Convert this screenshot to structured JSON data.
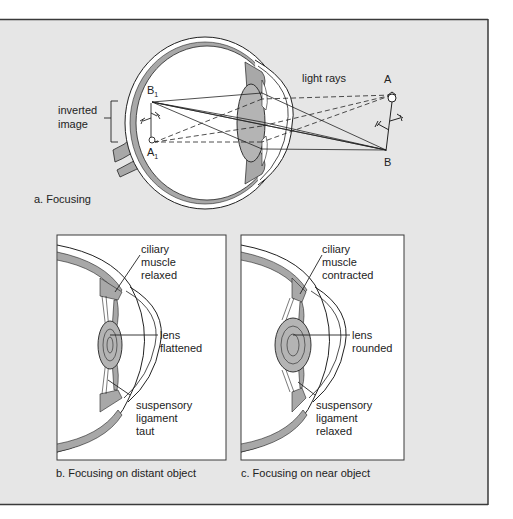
{
  "figure": {
    "colors": {
      "panel_bg": "#e6e6e6",
      "frame": "#3a3a3a",
      "tissue_gray": "#a8a8a8",
      "lens_gray": "#b4b4b4",
      "eye_white": "#ffffff",
      "ink": "#222222"
    },
    "panel_a": {
      "caption": "a. Focusing",
      "labels": {
        "inverted_image_1": "inverted",
        "inverted_image_2": "image",
        "light_rays": "light rays",
        "point_a": "A",
        "point_b": "B",
        "point_b1": "B",
        "point_b1_sub": "1",
        "point_a1": "A",
        "point_a1_sub": "1"
      }
    },
    "panel_b": {
      "caption": "b. Focusing on distant object",
      "labels": {
        "ciliary": [
          "ciliary",
          "muscle",
          "relaxed"
        ],
        "lens": [
          "lens",
          "flattened"
        ],
        "ligament": [
          "suspensory",
          "ligament",
          "taut"
        ]
      }
    },
    "panel_c": {
      "caption": "c. Focusing on near object",
      "labels": {
        "ciliary": [
          "ciliary",
          "muscle",
          "contracted"
        ],
        "lens": [
          "lens",
          "rounded"
        ],
        "ligament": [
          "suspensory",
          "ligament",
          "relaxed"
        ]
      }
    }
  }
}
